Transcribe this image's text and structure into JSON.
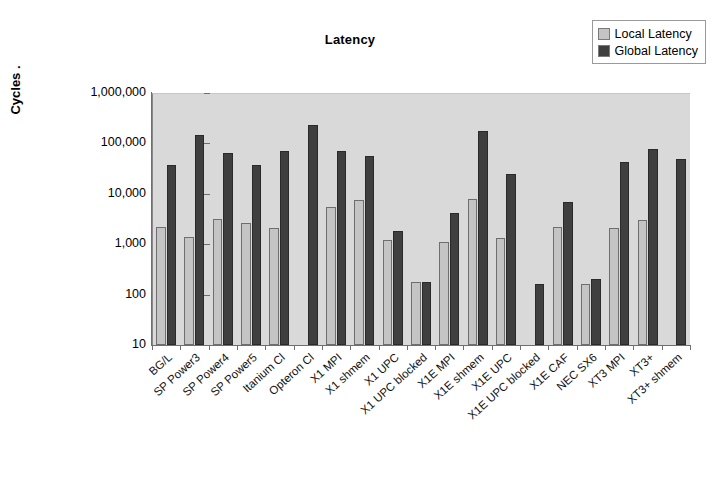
{
  "chart_data": {
    "type": "bar",
    "title": "Latency",
    "xlabel": "",
    "ylabel": "Cycles  .",
    "yscale": "log",
    "ylim": [
      10,
      1000000
    ],
    "ytick_labels": [
      "1,000,000",
      "100,000",
      "10,000",
      "1,000",
      "100",
      "10"
    ],
    "ytick_values": [
      1000000,
      100000,
      10000,
      1000,
      100,
      10
    ],
    "grid": false,
    "legend_position": "top-right",
    "categories": [
      "BG/L",
      "SP Power3",
      "SP Power4",
      "SP Power5",
      "Itanium Cl",
      "Opteron Cl",
      "X1 MPI",
      "X1 shmem",
      "X1 UPC",
      "X1 UPC blocked",
      "X1E MPI",
      "X1E shmem",
      "X1E UPC",
      "X1E UPC blocked",
      "X1E CAF",
      "NEC SX6",
      "XT3 MPI",
      "XT3+",
      "XT3+ shmem"
    ],
    "series": [
      {
        "name": "Local Latency",
        "color": "#c4c4c4",
        "values": [
          2200,
          1400,
          3100,
          2600,
          2100,
          null,
          5400,
          7600,
          1200,
          175,
          1100,
          7800,
          1350,
          null,
          2200,
          165,
          2100,
          3000,
          null
        ]
      },
      {
        "name": "Global Latency",
        "color": "#3f3f3f",
        "values": [
          37000,
          150000,
          65000,
          38000,
          70000,
          230000,
          72000,
          55000,
          1800,
          180,
          4200,
          180000,
          25000,
          165,
          6800,
          200,
          42000,
          78000,
          50000
        ]
      }
    ]
  },
  "legend": {
    "items": [
      {
        "label": "Local Latency",
        "color": "#c4c4c4"
      },
      {
        "label": "Global Latency",
        "color": "#3f3f3f"
      }
    ]
  }
}
